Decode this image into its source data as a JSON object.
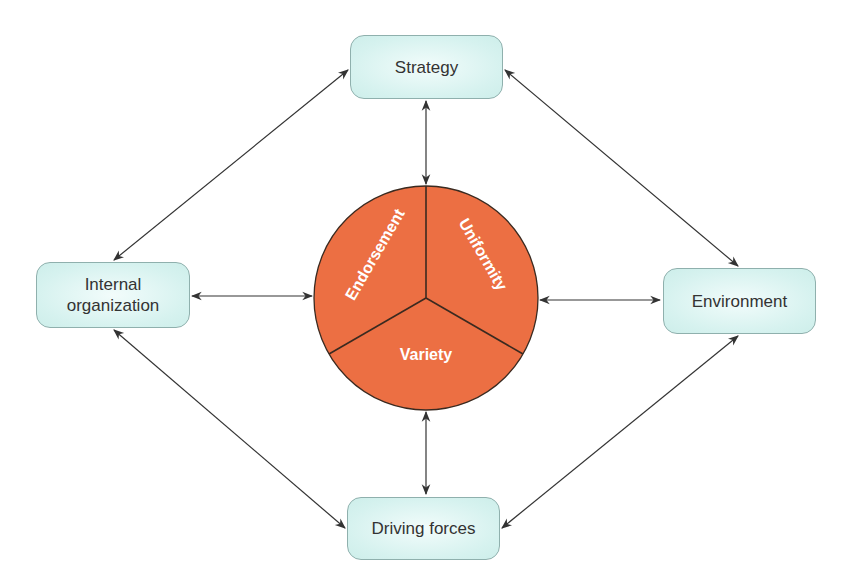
{
  "nodes": {
    "strategy": {
      "label": "Strategy"
    },
    "internal": {
      "label_line1": "Internal",
      "label_line2": "organization"
    },
    "environment": {
      "label": "Environment"
    },
    "driving": {
      "label": "Driving forces"
    }
  },
  "center": {
    "segments": [
      "Endorsement",
      "Uniformity",
      "Variety"
    ],
    "fill_color": "#ec6f43",
    "stroke_color": "#3a2a20"
  },
  "colors": {
    "box_fill": "#d6f2ef",
    "box_border": "#8fb0ad",
    "arrow": "#333333"
  }
}
